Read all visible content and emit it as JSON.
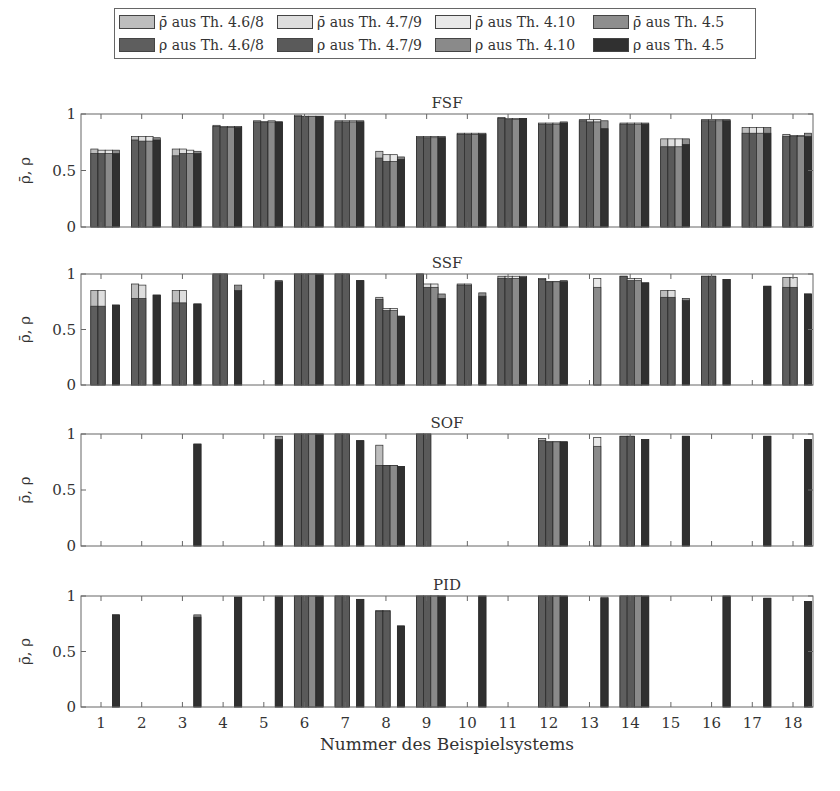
{
  "chart_data": {
    "type": "bar",
    "layout": "4 vertically stacked subplots, grouped bars (4 theorems per system), bar ρ with ρ̄ overlay above",
    "categories": [
      "1",
      "2",
      "3",
      "4",
      "5",
      "6",
      "7",
      "8",
      "9",
      "10",
      "11",
      "12",
      "13",
      "14",
      "15",
      "16",
      "17",
      "18"
    ],
    "xlabel": "Nummer des Beispielsystems",
    "ylabel": "ρ̄, ρ",
    "ylim": [
      0,
      1
    ],
    "yticks": [
      "0",
      "0.5",
      "1"
    ],
    "grid": false,
    "legend_position": "top, outside, 4 columns x 2 rows",
    "legend": [
      {
        "label": "ρ̄ aus Th. 4.6/8",
        "color": "#bdbdbd",
        "kind": "bar_rho"
      },
      {
        "label": "ρ̄ aus Th. 4.7/9",
        "color": "#dedede",
        "kind": "bar_rho"
      },
      {
        "label": "ρ̄ aus Th. 4.10",
        "color": "#e9e9e9",
        "kind": "bar_rho"
      },
      {
        "label": "ρ̄ aus Th. 4.5",
        "color": "#8e8e8e",
        "kind": "bar_rho"
      },
      {
        "label": "ρ aus Th. 4.6/8",
        "color": "#5e5e5e",
        "kind": "rho"
      },
      {
        "label": "ρ aus Th. 4.7/9",
        "color": "#5a5a5a",
        "kind": "rho"
      },
      {
        "label": "ρ aus Th. 4.10",
        "color": "#8a8a8a",
        "kind": "rho"
      },
      {
        "label": "ρ aus Th. 4.5",
        "color": "#303030",
        "kind": "rho"
      }
    ],
    "series_order": [
      "Th. 4.6/8",
      "Th. 4.7/9",
      "Th. 4.10",
      "Th. 4.5"
    ],
    "panels": [
      {
        "title": "FSF",
        "rho_bar": [
          [
            0.69,
            0.68,
            0.68,
            0.68
          ],
          [
            0.8,
            0.8,
            0.8,
            0.79
          ],
          [
            0.69,
            0.69,
            0.68,
            0.67
          ],
          [
            0.9,
            0.89,
            0.89,
            0.89
          ],
          [
            0.94,
            0.93,
            0.94,
            0.93
          ],
          [
            0.99,
            0.98,
            0.98,
            0.98
          ],
          [
            0.94,
            0.94,
            0.94,
            0.94
          ],
          [
            0.67,
            0.64,
            0.64,
            0.62
          ],
          [
            0.8,
            0.8,
            0.8,
            0.8
          ],
          [
            0.83,
            0.83,
            0.83,
            0.83
          ],
          [
            0.97,
            0.96,
            0.96,
            0.96
          ],
          [
            0.92,
            0.92,
            0.92,
            0.93
          ],
          [
            0.95,
            0.95,
            0.95,
            0.94
          ],
          [
            0.92,
            0.92,
            0.92,
            0.92
          ],
          [
            0.78,
            0.78,
            0.78,
            0.78
          ],
          [
            0.95,
            0.95,
            0.95,
            0.95
          ],
          [
            0.88,
            0.88,
            0.88,
            0.88
          ],
          [
            0.82,
            0.81,
            0.81,
            0.83
          ]
        ],
        "rho": [
          [
            0.65,
            0.65,
            0.65,
            0.65
          ],
          [
            0.77,
            0.76,
            0.76,
            0.77
          ],
          [
            0.63,
            0.65,
            0.65,
            0.65
          ],
          [
            0.89,
            0.88,
            0.88,
            0.88
          ],
          [
            0.93,
            0.93,
            0.93,
            0.93
          ],
          [
            0.98,
            0.98,
            0.98,
            0.98
          ],
          [
            0.93,
            0.93,
            0.93,
            0.93
          ],
          [
            0.61,
            0.58,
            0.58,
            0.6
          ],
          [
            0.79,
            0.79,
            0.79,
            0.79
          ],
          [
            0.82,
            0.82,
            0.82,
            0.82
          ],
          [
            0.96,
            0.95,
            0.95,
            0.96
          ],
          [
            0.91,
            0.91,
            0.91,
            0.92
          ],
          [
            0.94,
            0.93,
            0.93,
            0.87
          ],
          [
            0.91,
            0.91,
            0.91,
            0.91
          ],
          [
            0.71,
            0.71,
            0.71,
            0.73
          ],
          [
            0.94,
            0.94,
            0.94,
            0.94
          ],
          [
            0.83,
            0.83,
            0.83,
            0.83
          ],
          [
            0.8,
            0.8,
            0.8,
            0.8
          ]
        ]
      },
      {
        "title": "SSF",
        "rho_bar": [
          [
            0.85,
            0.85,
            null,
            0.72
          ],
          [
            0.91,
            0.9,
            null,
            0.81
          ],
          [
            0.85,
            0.85,
            null,
            0.73
          ],
          [
            1.0,
            1.0,
            null,
            0.9
          ],
          [
            null,
            null,
            null,
            0.94
          ],
          [
            1.0,
            1.0,
            1.0,
            1.0
          ],
          [
            1.0,
            1.0,
            null,
            0.94
          ],
          [
            0.79,
            0.69,
            0.69,
            0.62
          ],
          [
            1.0,
            0.91,
            0.91,
            0.82
          ],
          [
            0.91,
            0.91,
            null,
            0.83
          ],
          [
            0.98,
            0.98,
            0.98,
            0.98
          ],
          [
            0.96,
            0.93,
            0.93,
            0.94
          ],
          [
            null,
            null,
            0.96,
            null
          ],
          [
            0.98,
            0.96,
            0.96,
            0.92
          ],
          [
            0.85,
            0.85,
            null,
            0.78
          ],
          [
            0.98,
            0.98,
            null,
            0.95
          ],
          [
            null,
            null,
            null,
            0.89
          ],
          [
            0.97,
            0.97,
            null,
            0.82
          ]
        ],
        "rho": [
          [
            0.71,
            0.71,
            null,
            0.72
          ],
          [
            0.78,
            0.78,
            null,
            0.81
          ],
          [
            0.74,
            0.74,
            null,
            0.73
          ],
          [
            1.0,
            1.0,
            null,
            0.85
          ],
          [
            null,
            null,
            null,
            0.93
          ],
          [
            1.0,
            1.0,
            1.0,
            1.0
          ],
          [
            1.0,
            1.0,
            null,
            0.94
          ],
          [
            0.77,
            0.67,
            0.67,
            0.62
          ],
          [
            1.0,
            0.88,
            0.88,
            0.78
          ],
          [
            0.9,
            0.9,
            null,
            0.8
          ],
          [
            0.96,
            0.96,
            0.96,
            0.97
          ],
          [
            0.95,
            0.93,
            0.93,
            0.93
          ],
          [
            null,
            null,
            0.88,
            null
          ],
          [
            0.98,
            0.94,
            0.94,
            0.92
          ],
          [
            0.79,
            0.79,
            null,
            0.76
          ],
          [
            0.98,
            0.98,
            null,
            0.95
          ],
          [
            null,
            null,
            null,
            0.89
          ],
          [
            0.88,
            0.88,
            null,
            0.82
          ]
        ]
      },
      {
        "title": "SOF",
        "rho_bar": [
          [
            null,
            null,
            null,
            null
          ],
          [
            null,
            null,
            null,
            null
          ],
          [
            null,
            null,
            null,
            0.91
          ],
          [
            null,
            null,
            null,
            null
          ],
          [
            null,
            null,
            null,
            0.98
          ],
          [
            1.0,
            1.0,
            1.0,
            1.0
          ],
          [
            1.0,
            1.0,
            null,
            0.94
          ],
          [
            0.9,
            0.72,
            0.72,
            0.71
          ],
          [
            1.0,
            1.0,
            null,
            null
          ],
          [
            null,
            null,
            null,
            null
          ],
          [
            null,
            null,
            null,
            null
          ],
          [
            0.96,
            0.93,
            0.93,
            0.93
          ],
          [
            null,
            null,
            0.97,
            null
          ],
          [
            0.98,
            0.98,
            null,
            0.95
          ],
          [
            null,
            null,
            null,
            0.98
          ],
          [
            null,
            null,
            null,
            null
          ],
          [
            null,
            null,
            null,
            0.98
          ],
          [
            null,
            null,
            null,
            0.95
          ]
        ],
        "rho": [
          [
            null,
            null,
            null,
            null
          ],
          [
            null,
            null,
            null,
            null
          ],
          [
            null,
            null,
            null,
            0.91
          ],
          [
            null,
            null,
            null,
            null
          ],
          [
            null,
            null,
            null,
            0.95
          ],
          [
            1.0,
            1.0,
            1.0,
            1.0
          ],
          [
            1.0,
            1.0,
            null,
            0.94
          ],
          [
            0.72,
            0.72,
            0.72,
            0.71
          ],
          [
            1.0,
            1.0,
            null,
            null
          ],
          [
            null,
            null,
            null,
            null
          ],
          [
            null,
            null,
            null,
            null
          ],
          [
            0.94,
            0.93,
            0.93,
            0.93
          ],
          [
            null,
            null,
            0.89,
            null
          ],
          [
            0.98,
            0.98,
            null,
            0.95
          ],
          [
            null,
            null,
            null,
            0.98
          ],
          [
            null,
            null,
            null,
            null
          ],
          [
            null,
            null,
            null,
            0.98
          ],
          [
            null,
            null,
            null,
            0.95
          ]
        ]
      },
      {
        "title": "PID",
        "rho_bar": [
          [
            null,
            null,
            null,
            0.83
          ],
          [
            null,
            null,
            null,
            null
          ],
          [
            null,
            null,
            null,
            0.83
          ],
          [
            null,
            null,
            null,
            0.99
          ],
          [
            null,
            null,
            null,
            1.0
          ],
          [
            1.0,
            1.0,
            1.0,
            1.0
          ],
          [
            1.0,
            1.0,
            null,
            0.97
          ],
          [
            0.87,
            0.87,
            null,
            0.73
          ],
          [
            1.0,
            1.0,
            1.0,
            1.0
          ],
          [
            null,
            null,
            null,
            1.0
          ],
          [
            null,
            null,
            null,
            null
          ],
          [
            1.0,
            1.0,
            1.0,
            1.0
          ],
          [
            null,
            null,
            null,
            0.99
          ],
          [
            1.0,
            1.0,
            1.0,
            1.0
          ],
          [
            null,
            null,
            null,
            null
          ],
          [
            null,
            null,
            null,
            1.0
          ],
          [
            null,
            null,
            null,
            0.98
          ],
          [
            null,
            null,
            null,
            0.95
          ]
        ],
        "rho": [
          [
            null,
            null,
            null,
            0.83
          ],
          [
            null,
            null,
            null,
            null
          ],
          [
            null,
            null,
            null,
            0.81
          ],
          [
            null,
            null,
            null,
            0.99
          ],
          [
            null,
            null,
            null,
            0.99
          ],
          [
            1.0,
            1.0,
            1.0,
            1.0
          ],
          [
            1.0,
            1.0,
            null,
            0.97
          ],
          [
            0.86,
            0.86,
            null,
            0.73
          ],
          [
            1.0,
            1.0,
            1.0,
            1.0
          ],
          [
            null,
            null,
            null,
            1.0
          ],
          [
            null,
            null,
            null,
            null
          ],
          [
            1.0,
            1.0,
            1.0,
            1.0
          ],
          [
            null,
            null,
            null,
            0.98
          ],
          [
            1.0,
            1.0,
            1.0,
            1.0
          ],
          [
            null,
            null,
            null,
            null
          ],
          [
            null,
            null,
            null,
            1.0
          ],
          [
            null,
            null,
            null,
            0.98
          ],
          [
            null,
            null,
            null,
            0.95
          ]
        ]
      }
    ]
  },
  "legend_labels": [
    "ρ̄ aus Th. 4.6/8",
    "ρ̄ aus Th. 4.7/9",
    "ρ̄ aus Th. 4.10",
    "ρ̄ aus Th. 4.5",
    "ρ aus Th. 4.6/8",
    "ρ aus Th. 4.7/9",
    "ρ aus Th. 4.10",
    "ρ aus Th. 4.5"
  ],
  "colors": {
    "rho_bar": [
      "#bdbdbd",
      "#dedede",
      "#e9e9e9",
      "#8e8e8e"
    ],
    "rho": [
      "#5e5e5e",
      "#5a5a5a",
      "#8a8a8a",
      "#303030"
    ],
    "axis": "#666666",
    "edge": "#2a2a2a"
  }
}
